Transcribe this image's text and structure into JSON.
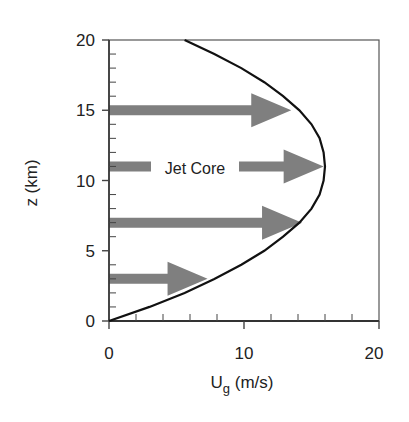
{
  "chart_data": {
    "type": "line",
    "title": "",
    "xlabel": "U_g (m/s)",
    "xlabel_main": "U",
    "xlabel_sub": "g",
    "xlabel_rest": " (m/s)",
    "ylabel": "z (km)",
    "xlim": [
      0,
      20
    ],
    "ylim": [
      0,
      20
    ],
    "x_ticks": [
      "0",
      "10",
      "20"
    ],
    "y_ticks": [
      "0",
      "5",
      "10",
      "15",
      "20"
    ],
    "grid": false,
    "series": [
      {
        "name": "geostrophic wind profile",
        "x": [
          0,
          3.0,
          5.6,
          7.8,
          9.8,
          11.5,
          12.9,
          14.1,
          15.0,
          15.6,
          15.9,
          16.0,
          15.9,
          15.6,
          15.0,
          14.1,
          12.9,
          11.5,
          9.8,
          7.8,
          5.6
        ],
        "y": [
          0,
          1,
          2,
          3,
          4,
          5,
          6,
          7,
          8,
          9,
          10,
          11,
          12,
          13,
          14,
          15,
          16,
          17,
          18,
          19,
          20
        ]
      }
    ],
    "arrows": [
      {
        "z": 3,
        "length": 7.3,
        "label": ""
      },
      {
        "z": 7,
        "length": 14.3,
        "label": ""
      },
      {
        "z": 11,
        "length": 15.9,
        "label": "Jet Core"
      },
      {
        "z": 15,
        "length": 13.5,
        "label": ""
      }
    ],
    "annotations": [
      "Jet Core"
    ]
  }
}
